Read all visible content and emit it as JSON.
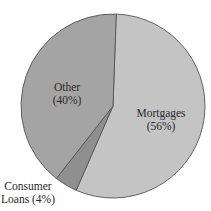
{
  "chart_data": {
    "type": "pie",
    "title": "",
    "slices": [
      {
        "label": "Mortgages",
        "value": 56,
        "display": "(56%)",
        "color": "#c4c4c4"
      },
      {
        "label": "Consumer Loans",
        "value": 4,
        "display": "(4%)",
        "color": "#8f8f8f"
      },
      {
        "label": "Other",
        "value": 40,
        "display": "(40%)",
        "color": "#a4a4a4"
      }
    ],
    "start_angle_deg": 2,
    "direction": "clockwise",
    "legend": "none (direct labels)"
  },
  "labels": {
    "other_name": "Other",
    "other_pct": "(40%)",
    "mortgages_name": "Mortgages",
    "mortgages_pct": "(56%)",
    "consumer_line1": "Consumer",
    "consumer_line2": "Loans (4%)"
  },
  "geometry": {
    "cx": 113,
    "cy": 106,
    "r": 92,
    "stroke": "#555555"
  }
}
